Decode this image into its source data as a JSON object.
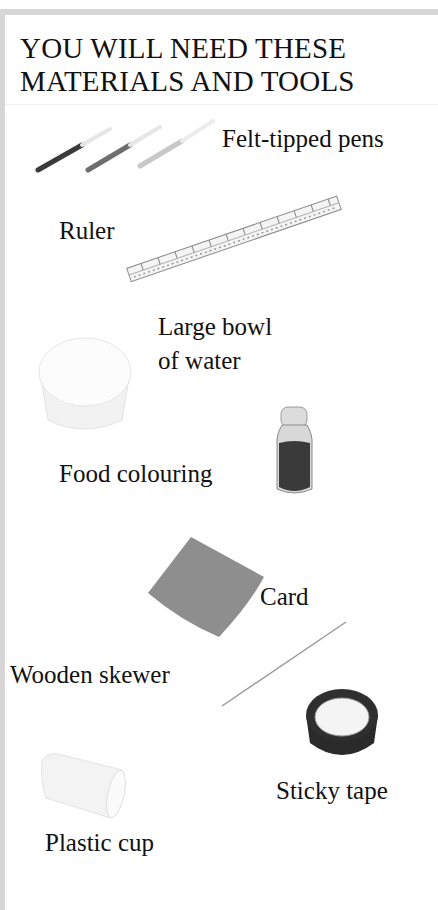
{
  "page": {
    "title_line1": "YOU WILL NEED THESE",
    "title_line2": "MATERIALS AND TOOLS"
  },
  "items": [
    {
      "label": "Felt-tipped pens",
      "icon": "felt-tip-pens"
    },
    {
      "label": "Ruler",
      "icon": "ruler"
    },
    {
      "label_line1": "Large bowl",
      "label_line2": "of water",
      "icon": "bowl"
    },
    {
      "label": "Food colouring",
      "icon": "bottle"
    },
    {
      "label": "Card",
      "icon": "card"
    },
    {
      "label": "Wooden skewer",
      "icon": "skewer"
    },
    {
      "label": "Sticky tape",
      "icon": "tape-roll"
    },
    {
      "label": "Plastic cup",
      "icon": "plastic-cup"
    }
  ],
  "colors": {
    "frame": "#d6d6d6",
    "text": "#111111",
    "card": "#8e8e8e",
    "tape": "#2a2a2a"
  }
}
